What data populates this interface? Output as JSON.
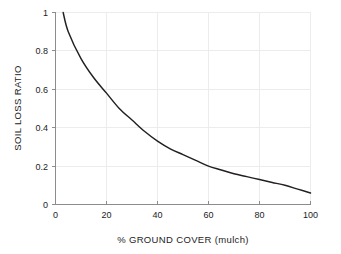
{
  "chart_data": {
    "type": "line",
    "title": "",
    "xlabel": "% GROUND COVER (mulch)",
    "ylabel": "SOIL LOSS RATIO",
    "xlim": [
      0,
      100
    ],
    "ylim": [
      0,
      1
    ],
    "grid": true,
    "legend": "none",
    "xticks": [
      "0",
      "20",
      "40",
      "60",
      "80",
      "100"
    ],
    "xtick_values": [
      0,
      20,
      40,
      60,
      80,
      100
    ],
    "yticks": [
      "0",
      "0.2",
      "0.4",
      "0.6",
      "0.8",
      "1"
    ],
    "ytick_values": [
      0,
      0.2,
      0.4,
      0.6,
      0.8,
      1
    ],
    "line_color": "#231f20",
    "grid_color": "#ececed",
    "axis_color": "#8c8c8c",
    "series": [
      {
        "name": "Soil loss ratio vs ground cover",
        "x": [
          3,
          5,
          10,
          15,
          20,
          25,
          30,
          35,
          40,
          45,
          50,
          55,
          60,
          65,
          70,
          75,
          80,
          85,
          90,
          95,
          100
        ],
        "values": [
          1.0,
          0.9,
          0.76,
          0.66,
          0.58,
          0.5,
          0.44,
          0.38,
          0.33,
          0.29,
          0.26,
          0.23,
          0.2,
          0.18,
          0.16,
          0.145,
          0.13,
          0.115,
          0.1,
          0.08,
          0.06
        ]
      }
    ]
  }
}
